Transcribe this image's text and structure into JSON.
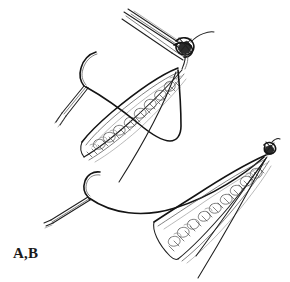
{
  "figure": {
    "panel_label": "A,B",
    "background_color": "#ffffff",
    "ink_color": "#1f1f1f",
    "accent_color": "#141414",
    "shading_color": "#8a8a8a"
  },
  "parts": {
    "upper_instrument": "needle-holder",
    "upper_knot": "square-knot",
    "upper_needle": "curved-suture-needle",
    "upper_needle_holder": "needle-holder",
    "upper_wound": "open-wound-upper",
    "upper_suture_loop": "suture-loop-upper",
    "upper_suture_tail": "suture-tail-upper",
    "lower_needle": "curved-suture-needle",
    "lower_needle_holder": "needle-holder",
    "lower_wound": "open-wound-lower",
    "lower_knot": "square-knot",
    "lower_suture_tails": "suture-tails-lower",
    "subcutaneous_tissue": "adipose-tissue",
    "dermal_hatching": "dermis-hatching"
  }
}
